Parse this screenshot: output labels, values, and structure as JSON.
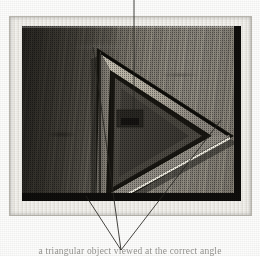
{
  "figure": {
    "kind": "halftone-photograph",
    "caption_text": "a triangular object viewed at the correct angle",
    "top_label_text": ""
  },
  "print": {
    "mount_label": "photographic print mount",
    "mount_color": "#efedE7",
    "border_color": "#b9b6ae"
  },
  "photo": {
    "background_label": "wooden board surface",
    "board_light_tone": "#8a8578",
    "board_dark_tone": "#55514a",
    "board_edge_color": "#100f0d",
    "highlight_color": "#f2efe6"
  },
  "object": {
    "name": "triangular prism",
    "vertices": {
      "top": [
        87,
        31
      ],
      "right": [
        222,
        119
      ],
      "bottom_left": [
        86,
        198
      ]
    },
    "outer_edge_color": "#14130f",
    "bevel_light_color": "#d9d4c6",
    "bevel_mid_color": "#9b968a",
    "inner_face_color": "#4f4b44",
    "inner_core_color": "#3b3833"
  },
  "annotations": {
    "top_leader": {
      "name": "top-leader-line",
      "from": [
        134,
        0
      ],
      "to": [
        134,
        118
      ],
      "marker": "detail marker on inner face"
    },
    "marker": {
      "name": "inner-face-detail-marker",
      "x": 121,
      "y": 112,
      "width": 26,
      "height": 17
    },
    "bottom_leaders": {
      "name": "bottom-leader-lines",
      "converge_at": [
        121,
        250
      ],
      "origins": [
        [
          86,
          196
        ],
        [
          93,
          47
        ],
        [
          221,
          120
        ]
      ]
    }
  }
}
